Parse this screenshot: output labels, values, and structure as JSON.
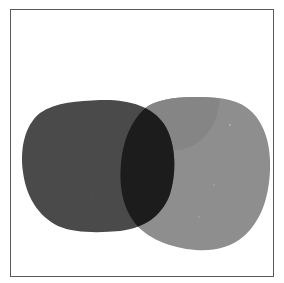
{
  "artwork": {
    "description": "Two overlapping rounded blob shapes in grayscale inside a thin rectangular frame",
    "colors": {
      "background": "#ffffff",
      "frame": "#5a5a5a",
      "dark_blob": "#4a4a4a",
      "light_blob": "#8e8e8e",
      "light_blob_shadow": "#858585",
      "intersection": "#1c1c1c"
    },
    "shapes": [
      {
        "name": "dark-blob",
        "label": "Dark blob"
      },
      {
        "name": "light-blob",
        "label": "Light blob"
      },
      {
        "name": "overlap-region",
        "label": "Overlap"
      }
    ]
  }
}
